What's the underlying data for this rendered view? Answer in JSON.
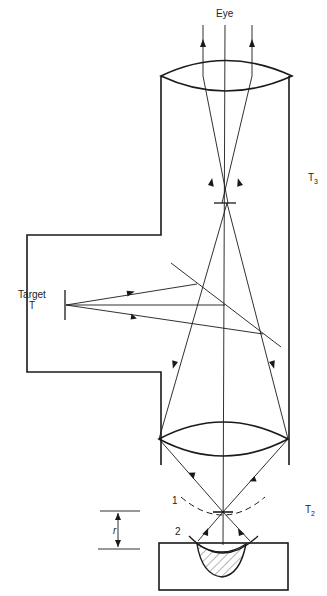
{
  "labels": {
    "eye": "Eye",
    "target_line1": "Target",
    "target_line2": "T",
    "t3_main": "T",
    "t3_sub": "3",
    "t2_main": "T",
    "t2_sub": "2",
    "pos1": "1",
    "pos2": "2",
    "r": "r"
  },
  "colors": {
    "line": "#1a1a1a",
    "background": "#ffffff"
  }
}
